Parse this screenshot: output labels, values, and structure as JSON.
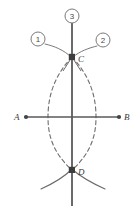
{
  "figure": {
    "stroke_color": "#5a5a5a",
    "dash_color": "#6e6e6e",
    "label_color": "#3a3a3a",
    "background": "#ffffff",
    "points": [
      {
        "id": "A",
        "label": "A",
        "x": 26,
        "y": 117,
        "marker": "dot",
        "label_x": 14,
        "label_y": 120
      },
      {
        "id": "B",
        "label": "B",
        "x": 119,
        "y": 117,
        "marker": "dot",
        "label_x": 124,
        "label_y": 120
      },
      {
        "id": "C",
        "label": "C",
        "x": 72,
        "y": 57,
        "marker": "square",
        "label_x": 78,
        "label_y": 61
      },
      {
        "id": "D",
        "label": "D",
        "x": 72,
        "y": 170,
        "marker": "square",
        "label_x": 78,
        "label_y": 174
      }
    ],
    "callouts": [
      {
        "id": "1",
        "label": "1",
        "cx": 38,
        "cy": 39,
        "r": 7,
        "leader_to_x": 70,
        "leader_to_y": 56
      },
      {
        "id": "2",
        "label": "2",
        "cx": 103,
        "cy": 40,
        "r": 7,
        "leader_to_x": 75,
        "leader_to_y": 56
      },
      {
        "id": "3",
        "label": "3",
        "cx": 72,
        "cy": 16,
        "r": 7,
        "leader_to_x": 72,
        "leader_to_y": 24
      }
    ],
    "lines": [
      {
        "id": "line-AB",
        "name": "horizontal-line-AB",
        "x1": 26,
        "y1": 117,
        "x2": 119,
        "y2": 117
      },
      {
        "id": "line-CD",
        "name": "vertical-line-CD",
        "x1": 72,
        "y1": 24,
        "x2": 72,
        "y2": 206
      }
    ],
    "arcs": {
      "lens_left": "M 72,57 C 52,78 48,100 48,117 C 48,134 52,152 72,170",
      "lens_right": "M 72,57 C 92,78 96,100 96,117 C 96,134 92,152 72,170",
      "top_leader_left": "M 45,44 C 54,46 64,50 71,57",
      "top_leader_right": "M 99,45 C 90,47 80,51 73,57",
      "top_stub_left": "M 72,57 L 64,70",
      "top_stub_right": "M 72,57 L 80,70",
      "bottom_arc_left": "M 42,188 C 53,183 64,176 71,170",
      "bottom_arc_right": "M 104,188 C 93,183 81,176 73,170"
    }
  }
}
